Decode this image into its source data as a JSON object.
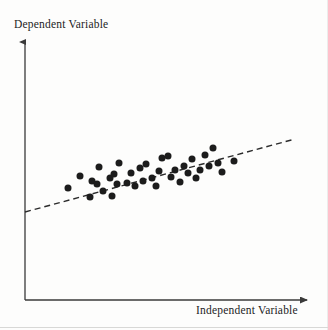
{
  "figure": {
    "name": "scatterplot-regression-diagram",
    "background_color": "#fdfdfc",
    "ink_color": "#1c1c1c"
  },
  "axes": {
    "y_label": "Dependent Variable",
    "x_label": "Independent Variable",
    "origin": [
      25,
      300
    ],
    "y_axis_top": [
      25,
      42
    ],
    "x_axis_right": [
      307,
      300
    ],
    "arrowheads": true,
    "axis_color": "#3a3a3a"
  },
  "chart_data": {
    "type": "scatter",
    "title": "",
    "xlabel": "Independent Variable",
    "ylabel": "Dependent Variable",
    "xlim": [
      25,
      307
    ],
    "ylim": [
      42,
      300
    ],
    "grid": false,
    "legend": false,
    "tick_labels": {
      "x": [],
      "y": []
    },
    "marker": {
      "shape": "circle",
      "color": "#1c1c1c",
      "diameter_px": 7
    },
    "points": [
      [
        68,
        188
      ],
      [
        80,
        176
      ],
      [
        90,
        197
      ],
      [
        92,
        181
      ],
      [
        97,
        184
      ],
      [
        99,
        167
      ],
      [
        103,
        191
      ],
      [
        110,
        178
      ],
      [
        112,
        196
      ],
      [
        114,
        174
      ],
      [
        117,
        184
      ],
      [
        119,
        163
      ],
      [
        127,
        183
      ],
      [
        131,
        173
      ],
      [
        135,
        186
      ],
      [
        140,
        168
      ],
      [
        143,
        181
      ],
      [
        146,
        164
      ],
      [
        152,
        178
      ],
      [
        156,
        186
      ],
      [
        159,
        171
      ],
      [
        162,
        158
      ],
      [
        168,
        156
      ],
      [
        171,
        177
      ],
      [
        175,
        170
      ],
      [
        180,
        182
      ],
      [
        184,
        166
      ],
      [
        188,
        173
      ],
      [
        192,
        159
      ],
      [
        196,
        178
      ],
      [
        200,
        170
      ],
      [
        205,
        155
      ],
      [
        209,
        166
      ],
      [
        213,
        148
      ],
      [
        218,
        163
      ],
      [
        222,
        172
      ],
      [
        234,
        161
      ]
    ],
    "trend_line": {
      "style": "dashed",
      "color": "#2b2b2b",
      "width_px": 1.4,
      "dash_pattern": [
        6,
        4
      ],
      "start": [
        25,
        212
      ],
      "end": [
        295,
        139
      ]
    }
  }
}
